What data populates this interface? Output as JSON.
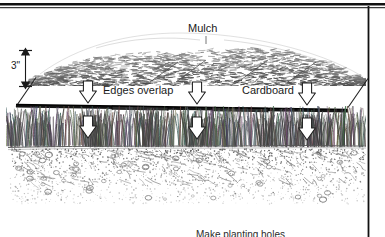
{
  "diagram": {
    "labels": {
      "mulch": "Mulch",
      "edges_overlap": "Edges overlap",
      "cardboard": "Cardboard",
      "depth": "3\"",
      "planting_holes": "Make planting holes"
    },
    "layers": [
      {
        "name": "mulch",
        "label": "Mulch",
        "depth": "3\""
      },
      {
        "name": "cardboard",
        "label": "Cardboard"
      },
      {
        "name": "grass",
        "label": ""
      },
      {
        "name": "soil",
        "label": ""
      }
    ],
    "arrow_pairs": 3,
    "colors": {
      "ink": "#1a1a1a",
      "mulch_stroke": "#3a3a3a",
      "grass_stroke": "#4a4a4a",
      "soil_stroke": "#6b6b6b",
      "cardboard": "#111111",
      "background": "#ffffff",
      "border": "#000000"
    }
  }
}
